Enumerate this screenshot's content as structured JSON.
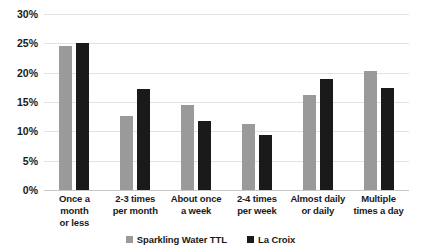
{
  "chart_data": {
    "type": "bar",
    "title": "",
    "xlabel": "",
    "ylabel": "",
    "ylim": [
      0,
      30
    ],
    "ytick_values": [
      0,
      5,
      10,
      15,
      20,
      25,
      30
    ],
    "ytick_labels": [
      "0%",
      "5%",
      "10%",
      "15%",
      "20%",
      "25%",
      "30%"
    ],
    "grid": true,
    "legend_position": "bottom",
    "categories": [
      "Once a month\nor less",
      "2-3 times\nper month",
      "About once\na week",
      "2-4 times\nper week",
      "Almost daily\nor daily",
      "Multiple\ntimes a day"
    ],
    "series": [
      {
        "name": "Sparkling Water TTL",
        "color": "#9a9a9a",
        "values": [
          24.5,
          12.7,
          14.5,
          11.2,
          16.2,
          20.3
        ]
      },
      {
        "name": "La Croix",
        "color": "#1a1a1a",
        "values": [
          25.1,
          17.3,
          11.7,
          9.3,
          19.0,
          17.4
        ]
      }
    ]
  }
}
